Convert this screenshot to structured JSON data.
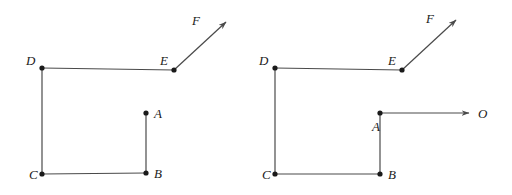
{
  "figure": {
    "background_color": "#ffffff",
    "line_color": "#4a4a4a",
    "dot_color": "#1a1a1a",
    "label_color": "#1a1a1a",
    "width": 512,
    "height": 195
  },
  "diagrams": [
    {
      "id": "left",
      "name": "left-diagram",
      "points": [
        {
          "label": "A",
          "x": 146,
          "y": 113,
          "label_x": 154,
          "label_y": 118,
          "dot": true
        },
        {
          "label": "B",
          "x": 146,
          "y": 173,
          "label_x": 154,
          "label_y": 178,
          "dot": true
        },
        {
          "label": "C",
          "x": 42,
          "y": 174,
          "label_x": 30,
          "label_y": 179,
          "dot": true
        },
        {
          "label": "D",
          "x": 42,
          "y": 68,
          "label_x": 27,
          "label_y": 64,
          "dot": true
        },
        {
          "label": "E",
          "x": 174,
          "y": 70,
          "label_x": 161,
          "label_y": 64,
          "dot": true
        },
        {
          "label": "F",
          "x": 228,
          "y": 20,
          "label_x": 194,
          "label_y": 23,
          "dot": false
        }
      ],
      "segments": [
        {
          "name": "segment-A-B",
          "from": "A",
          "to": "B"
        },
        {
          "name": "segment-B-C",
          "from": "B",
          "to": "C"
        },
        {
          "name": "segment-C-D",
          "from": "C",
          "to": "D"
        },
        {
          "name": "segment-D-E",
          "from": "D",
          "to": "E"
        }
      ],
      "arrows": [
        {
          "name": "ray-E-F",
          "from": "E",
          "to": "F",
          "label": "F"
        }
      ]
    },
    {
      "id": "right",
      "name": "right-diagram",
      "points": [
        {
          "label": "A",
          "x": 380,
          "y": 113,
          "label_x": 374,
          "label_y": 130,
          "dot": true
        },
        {
          "label": "B",
          "x": 380,
          "y": 174,
          "label_x": 388,
          "label_y": 179,
          "dot": true
        },
        {
          "label": "C",
          "x": 275,
          "y": 174,
          "label_x": 263,
          "label_y": 179,
          "dot": true
        },
        {
          "label": "D",
          "x": 275,
          "y": 68,
          "label_x": 260,
          "label_y": 64,
          "dot": true
        },
        {
          "label": "E",
          "x": 402,
          "y": 70,
          "label_x": 389,
          "label_y": 64,
          "dot": true
        },
        {
          "label": "F",
          "x": 458,
          "y": 18,
          "label_x": 428,
          "label_y": 21,
          "dot": false
        },
        {
          "label": "O",
          "x": 471,
          "y": 113,
          "label_x": 479,
          "label_y": 118,
          "dot": false
        }
      ],
      "segments": [
        {
          "name": "segment-A-B",
          "from": "A",
          "to": "B"
        },
        {
          "name": "segment-B-C",
          "from": "B",
          "to": "C"
        },
        {
          "name": "segment-C-D",
          "from": "C",
          "to": "D"
        },
        {
          "name": "segment-D-E",
          "from": "D",
          "to": "E"
        }
      ],
      "arrows": [
        {
          "name": "ray-E-F",
          "from": "E",
          "to": "F",
          "label": "F"
        },
        {
          "name": "ray-A-O",
          "from": "A",
          "to": "O",
          "label": "O"
        }
      ]
    }
  ],
  "labels": {
    "left": {
      "A": "A",
      "B": "B",
      "C": "C",
      "D": "D",
      "E": "E",
      "F": "F"
    },
    "right": {
      "A": "A",
      "B": "B",
      "C": "C",
      "D": "D",
      "E": "E",
      "F": "F",
      "O": "O"
    }
  }
}
